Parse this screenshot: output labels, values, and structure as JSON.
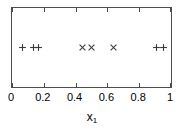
{
  "chart_data": {
    "type": "scatter",
    "title": "",
    "subtitle": "",
    "xlabel": "x1",
    "xlabel_base": "x",
    "xlabel_sub": "1",
    "ylabel": "",
    "xlim": [
      0,
      1
    ],
    "ylim": [
      0,
      1
    ],
    "grid": false,
    "legend": false,
    "legend_position": "none",
    "y_axis_ticks": [],
    "y_tick_labels": [],
    "x_ticks": [
      0,
      0.2,
      0.4,
      0.6,
      0.8,
      1
    ],
    "x_tick_labels": [
      "0",
      "0.2",
      "0.4",
      "0.6",
      "0.8",
      "1"
    ],
    "tick_direction": "in",
    "tick_sides": [
      "top",
      "bottom"
    ],
    "marker_y": 0.5,
    "series": [
      {
        "name": "plus-group",
        "marker": "plus",
        "color": "#3a3a3a",
        "x": [
          0.068,
          0.137,
          0.168,
          0.906,
          0.95
        ],
        "y": [
          0.5,
          0.5,
          0.5,
          0.5,
          0.5
        ]
      },
      {
        "name": "cross-group",
        "marker": "cross",
        "color": "#3a3a3a",
        "x": [
          0.441,
          0.503,
          0.64
        ],
        "y": [
          0.5,
          0.5,
          0.5
        ]
      }
    ]
  },
  "figure": {
    "background_color": "#ffffff",
    "frame_color": "#4d4d4d",
    "marker_color": "#3a3a3a",
    "text_color": "#000000"
  }
}
